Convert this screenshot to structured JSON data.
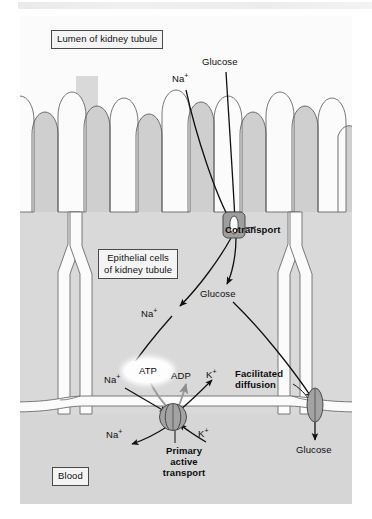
{
  "figure": {
    "background_color": "#fbfbfb",
    "cell_fill": "#d9d9d9",
    "lumen_fill": "#f2f2f2",
    "blood_fill": "#d4d4d4",
    "membrane_color": "#ffffff",
    "outline_color": "#555555",
    "protein_fill": "#9a9a9a",
    "arrow_color": "#111111"
  },
  "boxed_labels": {
    "lumen": "Lumen of kidney tubule",
    "epithelial": "Epithelial cells\nof kidney tubule",
    "blood": "Blood"
  },
  "labels": {
    "glucose_top": "Glucose",
    "na_top": "Na",
    "na_top_charge": "+",
    "cotransport": "Cotransport",
    "glucose_mid": "Glucose",
    "na_mid": "Na",
    "na_mid_charge": "+",
    "atp": "ATP",
    "na_left": "Na",
    "na_left_charge": "+",
    "adp": "ADP",
    "k_upper": "K",
    "k_upper_charge": "+",
    "facilitated_diffusion": "Facilitated\ndiffusion",
    "na_lower": "Na",
    "na_lower_charge": "+",
    "k_lower": "K",
    "k_lower_charge": "+",
    "primary_active_transport": "Primary\nactive\ntransport",
    "glucose_bottom": "Glucose"
  },
  "proteins": [
    {
      "name": "cotransporter",
      "type": "Na+/glucose cotransporter",
      "x": 213,
      "y": 209
    },
    {
      "name": "sodium-potassium-pump",
      "type": "Na+/K+ ATPase",
      "x": 153,
      "y": 401
    },
    {
      "name": "glucose-carrier",
      "type": "glucose carrier protein",
      "x": 299,
      "y": 399
    }
  ],
  "microvilli": {
    "count": 10,
    "region": "apical surface facing lumen"
  }
}
